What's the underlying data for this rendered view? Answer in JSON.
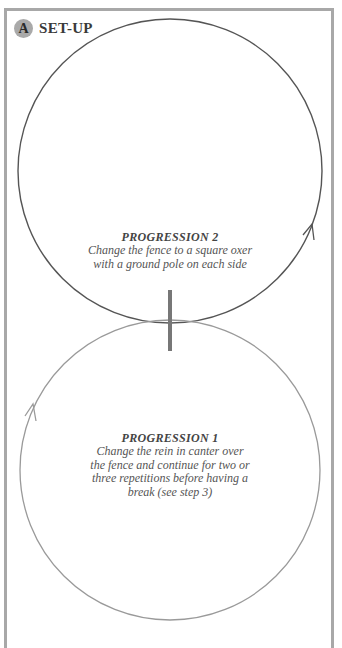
{
  "header": {
    "badge": "A",
    "title": "SET-UP"
  },
  "progressions": [
    {
      "heading": "PROGRESSION 2",
      "lines": [
        "Change the fence to a square oxer",
        "with a ground pole on each side"
      ]
    },
    {
      "heading": "PROGRESSION 1",
      "lines": [
        "Change the rein in canter over",
        "the fence and continue for two or",
        "three repetitions before having a",
        "break (see step 3)"
      ]
    }
  ],
  "diagram": {
    "upper_circle": {
      "cx": 170,
      "cy": 171,
      "r": 152,
      "stroke": "#555555"
    },
    "lower_circle": {
      "cx": 170,
      "cy": 470,
      "r": 150,
      "stroke": "#9a9a9a"
    },
    "fence": {
      "x": 170,
      "y1": 290,
      "y2": 351,
      "color": "#777777"
    },
    "colors": {
      "frame": "#a8a8a8",
      "badge": "#a9a9a9"
    }
  }
}
